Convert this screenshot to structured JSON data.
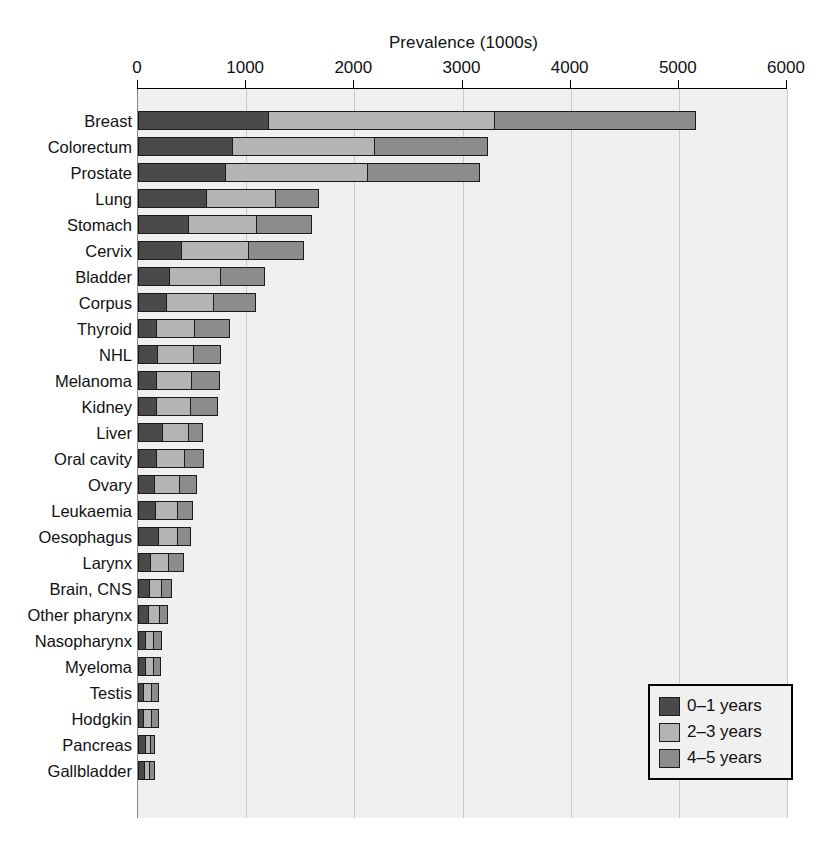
{
  "chart_data": {
    "type": "bar",
    "orientation": "horizontal",
    "stacked": true,
    "title": "Prevalence (1000s)",
    "xlabel": "Prevalence (1000s)",
    "ylabel": "",
    "xlim": [
      0,
      6000
    ],
    "xticks": [
      0,
      1000,
      2000,
      3000,
      4000,
      5000,
      6000
    ],
    "xticklabels": [
      "0",
      "1000",
      "2000",
      "3000",
      "4000",
      "5000",
      "6000"
    ],
    "grid": "vertical",
    "legend_position": "bottom-right",
    "categories": [
      "Breast",
      "Colorectum",
      "Prostate",
      "Lung",
      "Stomach",
      "Cervix",
      "Bladder",
      "Corpus",
      "Thyroid",
      "NHL",
      "Melanoma",
      "Kidney",
      "Liver",
      "Oral cavity",
      "Ovary",
      "Leukaemia",
      "Oesophagus",
      "Larynx",
      "Brain, CNS",
      "Other pharynx",
      "Nasopharynx",
      "Myeloma",
      "Testis",
      "Hodgkin",
      "Pancreas",
      "Gallbladder"
    ],
    "series": [
      {
        "name": "0–1 years",
        "color": "#4a4a4a",
        "values": [
          1210,
          880,
          815,
          635,
          470,
          410,
          295,
          270,
          180,
          185,
          175,
          180,
          235,
          175,
          160,
          165,
          190,
          120,
          110,
          100,
          70,
          70,
          60,
          55,
          70,
          65
        ]
      },
      {
        "name": "2–3 years",
        "color": "#b4b4b4",
        "values": [
          2100,
          1320,
          1320,
          650,
          640,
          625,
          485,
          445,
          360,
          345,
          330,
          315,
          250,
          270,
          240,
          215,
          190,
          180,
          120,
          110,
          90,
          85,
          80,
          80,
          60,
          55
        ]
      },
      {
        "name": "4–5 years",
        "color": "#8c8c8c",
        "values": [
          1870,
          1050,
          1050,
          405,
          515,
          515,
          410,
          395,
          330,
          260,
          275,
          265,
          135,
          185,
          160,
          150,
          130,
          140,
          100,
          90,
          80,
          80,
          70,
          75,
          50,
          55
        ]
      }
    ],
    "totals": [
      5180,
      3250,
      3185,
      1690,
      1625,
      1550,
      1190,
      1110,
      870,
      790,
      780,
      760,
      620,
      630,
      560,
      530,
      510,
      440,
      330,
      300,
      240,
      235,
      210,
      210,
      180,
      175
    ]
  },
  "legend": {
    "items": [
      {
        "label": "0–1 years",
        "color": "#4a4a4a"
      },
      {
        "label": "2–3 years",
        "color": "#b4b4b4"
      },
      {
        "label": "4–5 years",
        "color": "#8c8c8c"
      }
    ]
  },
  "colors": {
    "plot_background": "#f0f0f0",
    "gridline": "#c9c9c9",
    "axis": "#000000",
    "bar_outline": "#1a1a1a"
  }
}
